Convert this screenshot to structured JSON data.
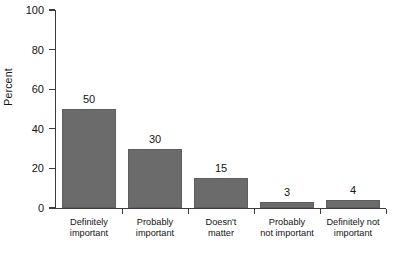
{
  "chart_data": {
    "type": "bar",
    "title": "",
    "xlabel": "",
    "ylabel": "Percent",
    "categories": [
      "Definitely important",
      "Probably important",
      "Doesn't matter",
      "Probably not important",
      "Definitely not important"
    ],
    "category_lines": [
      [
        "Definitely",
        "important"
      ],
      [
        "Probably",
        "important"
      ],
      [
        "Doesn't",
        "matter"
      ],
      [
        "Probably",
        "not important"
      ],
      [
        "Definitely not",
        "important"
      ]
    ],
    "values": [
      50,
      30,
      15,
      3,
      4
    ],
    "value_labels": [
      "50",
      "30",
      "15",
      "3",
      "4"
    ],
    "ylim": [
      0,
      100
    ],
    "yticks": [
      0,
      20,
      40,
      60,
      80,
      100
    ],
    "ytick_labels": [
      "0",
      "20",
      "40",
      "60",
      "80",
      "100"
    ],
    "grid": false,
    "legend": false,
    "bar_color": "#6b6b6b",
    "axis_color": "#3c3c3c",
    "background_color": "#ffffff"
  },
  "axes": {
    "y_title": "Percent"
  }
}
